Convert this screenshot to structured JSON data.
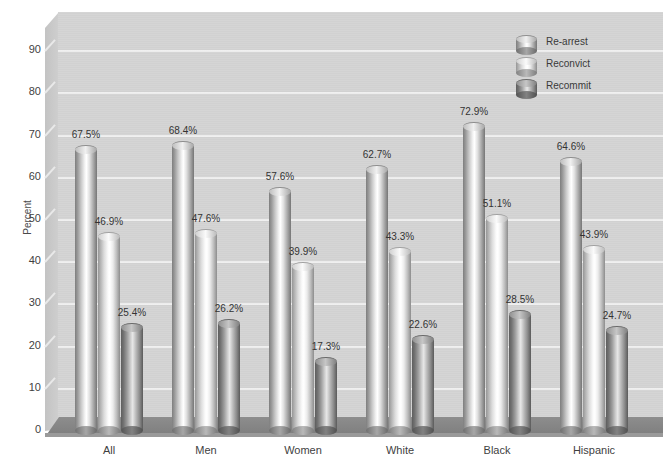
{
  "chart_data": {
    "type": "bar",
    "title": "",
    "xlabel": "",
    "ylabel": "Percent",
    "ylim": [
      0,
      95
    ],
    "yticks": [
      0,
      10,
      20,
      30,
      40,
      50,
      60,
      70,
      80,
      90
    ],
    "grid": true,
    "legend_position": "top-right",
    "categories": [
      "All",
      "Men",
      "Women",
      "White",
      "Black",
      "Hispanic"
    ],
    "series": [
      {
        "name": "Re-arrest",
        "values": [
          67.5,
          68.4,
          57.6,
          62.7,
          72.9,
          64.6
        ],
        "labels": [
          "67.5%",
          "68.4%",
          "57.6%",
          "62.7%",
          "72.9%",
          "64.6%"
        ]
      },
      {
        "name": "Reconvict",
        "values": [
          46.9,
          47.6,
          39.9,
          43.3,
          51.1,
          43.9
        ],
        "labels": [
          "46.9%",
          "47.6%",
          "39.9%",
          "43.3%",
          "51.1%",
          "43.9%"
        ]
      },
      {
        "name": "Recommit",
        "values": [
          25.4,
          26.2,
          17.3,
          22.6,
          28.5,
          24.7
        ],
        "labels": [
          "25.4%",
          "26.2%",
          "17.3%",
          "22.6%",
          "28.5%",
          "24.7%"
        ]
      }
    ]
  },
  "axis": {
    "y_title": "Percent",
    "y_tick_labels": [
      "90",
      "80",
      "70",
      "60",
      "50",
      "40",
      "30",
      "20",
      "10",
      "0"
    ]
  },
  "legend": {
    "items": [
      {
        "label": "Re-arrest",
        "swatch": "cylinder-medium",
        "color": "#9b9b9b"
      },
      {
        "label": "Reconvict",
        "swatch": "cylinder-light",
        "color": "#c9c9c9"
      },
      {
        "label": "Recommit",
        "swatch": "cylinder-dark",
        "color": "#6f6f6f"
      }
    ]
  },
  "colors": {
    "plot_background": "#d3d3d3",
    "gridline": "#efefef",
    "floor": "#858585",
    "page_background": "#ffffff",
    "text": "#3a3a3a"
  }
}
